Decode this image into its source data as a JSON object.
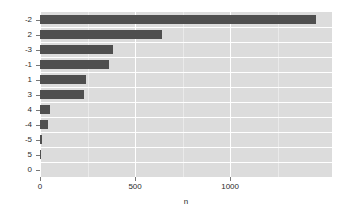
{
  "chart_data": {
    "type": "bar",
    "orientation": "horizontal",
    "title": "",
    "subtitle": "",
    "xlabel": "n",
    "ylabel": "",
    "categories": [
      "-2",
      "2",
      "-3",
      "-1",
      "1",
      "3",
      "4",
      "-4",
      "-5",
      "5",
      "0"
    ],
    "values": [
      1453,
      642,
      384,
      363,
      242,
      232,
      53,
      42,
      9,
      2,
      0
    ],
    "xlim": [
      0,
      1536
    ],
    "x_ticks": [
      0,
      500,
      1000
    ],
    "x_tick_labels": [
      "0",
      "500",
      "1000"
    ],
    "x_minor_ticks": [
      250,
      750,
      1250
    ],
    "grid": true,
    "legend": "none",
    "bar_color": "#4f4f4f",
    "panel_background": "#dcdcdc",
    "gridline_color": "#ffffff",
    "series": [
      {
        "name": "n",
        "values": [
          1453,
          642,
          384,
          363,
          242,
          232,
          53,
          42,
          9,
          2,
          0
        ]
      }
    ]
  },
  "axis": {
    "x_title": "n"
  }
}
